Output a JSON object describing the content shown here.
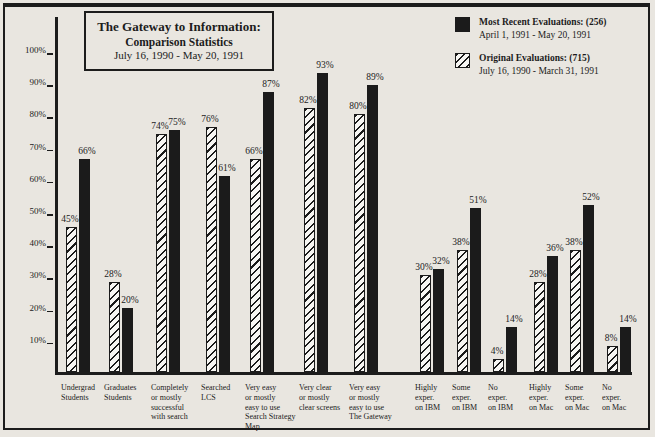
{
  "page": {
    "background": "#e9e6e0",
    "ink": "#1c1c1c"
  },
  "title": {
    "line1": "The Gateway to Information:",
    "line2": "Comparison Statistics",
    "line3": "July 16, 1990 - May 20, 1991"
  },
  "legend": {
    "entries": [
      {
        "label": "Most Recent Evaluations: (256)",
        "dates": "April 1, 1991 - May 20, 1991",
        "swatch": "solid-black-square"
      },
      {
        "label": "Original Evaluations: (715)",
        "dates": "July 16, 1990 - March 31, 1991",
        "swatch": "diagonal-hatch-square"
      }
    ]
  },
  "chart_data": {
    "type": "bar",
    "title": "The Gateway to Information: Comparison Statistics",
    "subtitle": "July 16, 1990 - May 20, 1991",
    "xlabel": "",
    "ylabel": "",
    "ylim": [
      0,
      100
    ],
    "yticks": [
      100,
      90,
      80,
      70,
      60,
      50,
      40,
      30,
      20,
      10
    ],
    "ytick_format": "percent",
    "grid": false,
    "legend_position": "top-right",
    "categories": [
      "Undergrad Students",
      "Graduates Students",
      "Completely or mostly successful with search",
      "Searched LCS",
      "Very easy or mostly easy to use Search Strategy Map",
      "Very clear or mostly clear screens",
      "Very easy or mostly easy to use The Gateway",
      "Highly exper. on IBM",
      "Some exper. on IBM",
      "No exper. on IBM",
      "Highly exper. on Mac",
      "Some exper. on Mac",
      "No exper. on Mac"
    ],
    "series": [
      {
        "name": "Original Evaluations: (715) July 16, 1990 - March 31, 1991",
        "style": "hatched",
        "values": [
          45,
          28,
          74,
          76,
          66,
          82,
          80,
          30,
          38,
          4,
          28,
          38,
          8
        ]
      },
      {
        "name": "Most Recent Evaluations: (256) April 1, 1991 - May 20, 1991",
        "style": "solid",
        "values": [
          66,
          20,
          75,
          61,
          87,
          93,
          89,
          32,
          51,
          14,
          36,
          52,
          14
        ]
      }
    ]
  },
  "layout": {
    "baseline_y": 372,
    "px_per_pct": 3.22,
    "bar_width": 11,
    "group_centers": [
      78,
      121,
      168,
      218,
      262,
      316,
      366,
      432,
      469,
      505,
      546,
      582,
      619
    ],
    "catlabel_top": 383,
    "category_lines": [
      [
        "Undergrad",
        "Students"
      ],
      [
        "Graduates",
        "Students"
      ],
      [
        "Completely",
        "or mostly",
        "successful",
        "with search"
      ],
      [
        "Searched",
        "LCS"
      ],
      [
        "Very easy",
        "or mostly",
        "easy to use",
        "Search Strategy",
        "Map"
      ],
      [
        "Very clear",
        "or mostly",
        "clear screens"
      ],
      [
        "Very easy",
        "or mostly",
        "easy to use",
        "The Gateway"
      ],
      [
        "Highly",
        "exper.",
        "on IBM"
      ],
      [
        "Some",
        "exper.",
        "on IBM"
      ],
      [
        "No",
        "exper.",
        "on IBM"
      ],
      [
        "Highly",
        "exper.",
        "on Mac"
      ],
      [
        "Some",
        "exper.",
        "on Mac"
      ],
      [
        "No",
        "exper.",
        "on Mac"
      ]
    ]
  }
}
